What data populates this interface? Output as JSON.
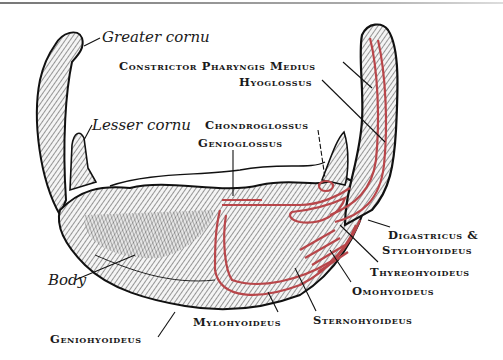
{
  "figure": {
    "colors": {
      "bone_ink": "#1a1a1a",
      "muscle_outline": "#b8464a",
      "background": "#ffffff"
    },
    "bone_parts": [
      {
        "id": "greater-cornu",
        "label": "Greater cornu"
      },
      {
        "id": "lesser-cornu",
        "label": "Lesser cornu"
      },
      {
        "id": "body",
        "label": "Body"
      }
    ],
    "muscles": [
      {
        "id": "constrictor",
        "label": "Constrictor Pharyngis Medius"
      },
      {
        "id": "hyoglossus",
        "label": "Hyoglossus"
      },
      {
        "id": "chondroglossus",
        "label": "Chondroglossus"
      },
      {
        "id": "genioglossus",
        "label": "Genioglossus"
      },
      {
        "id": "digastricus",
        "label": "Digastricus &"
      },
      {
        "id": "stylohyoideus",
        "label": "Stylohyoideus"
      },
      {
        "id": "thyreohyoideus",
        "label": "Thyreohyoideus"
      },
      {
        "id": "omohyoideus",
        "label": "Omohyoideus"
      },
      {
        "id": "sternohyoideus",
        "label": "Sternohyoideus"
      },
      {
        "id": "mylohyoideus",
        "label": "Mylohyoideus"
      },
      {
        "id": "geniohyoideus",
        "label": "Geniohyoideus"
      }
    ]
  }
}
